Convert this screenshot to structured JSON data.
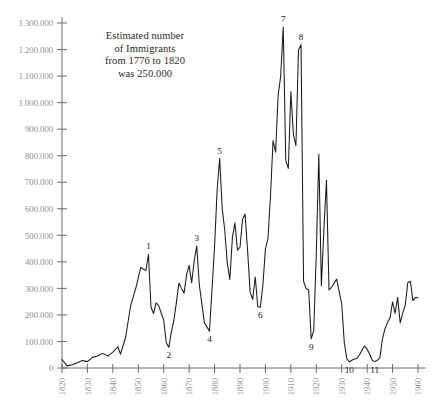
{
  "chart_data": {
    "type": "line",
    "title": "",
    "subtitle": "",
    "xlabel": "",
    "ylabel": "",
    "xlim": [
      1820,
      1960
    ],
    "ylim": [
      0,
      1300000
    ],
    "grid": false,
    "legend": "none",
    "y_tick_labels": [
      "1.300.000",
      "1.200.000",
      "1.100.000",
      "1.000.000",
      "900.000",
      "800.000",
      "700.000",
      "600.000",
      "500.000",
      "400.000",
      "300.000",
      "200.000",
      "100.000",
      "0"
    ],
    "y_tick_values": [
      1300000,
      1200000,
      1100000,
      1000000,
      900000,
      800000,
      700000,
      600000,
      500000,
      400000,
      300000,
      200000,
      100000,
      0
    ],
    "x_tick_labels": [
      "1820",
      "1830",
      "1840",
      "1850",
      "1860",
      "1870",
      "1880",
      "1890",
      "1900",
      "1910",
      "1920",
      "1930",
      "1940",
      "1950",
      "1960"
    ],
    "x_tick_values": [
      1820,
      1830,
      1840,
      1850,
      1860,
      1870,
      1880,
      1890,
      1900,
      1910,
      1920,
      1930,
      1940,
      1950,
      1960
    ],
    "series": [
      {
        "name": "Estimated number of Immigrants",
        "x": [
          1820,
          1822,
          1824,
          1826,
          1828,
          1830,
          1832,
          1834,
          1836,
          1838,
          1840,
          1842,
          1843,
          1845,
          1847,
          1849,
          1851,
          1852,
          1853,
          1854,
          1855,
          1856,
          1857,
          1858,
          1860,
          1861,
          1862,
          1863,
          1864,
          1865,
          1866,
          1867,
          1868,
          1869,
          1870,
          1871,
          1872,
          1873,
          1874,
          1876,
          1878,
          1880,
          1881,
          1882,
          1883,
          1884,
          1885,
          1886,
          1887,
          1888,
          1889,
          1890,
          1891,
          1892,
          1893,
          1894,
          1895,
          1896,
          1897,
          1898,
          1899,
          1900,
          1901,
          1902,
          1903,
          1904,
          1905,
          1906,
          1907,
          1908,
          1909,
          1910,
          1911,
          1912,
          1913,
          1914,
          1915,
          1916,
          1917,
          1918,
          1919,
          1920,
          1921,
          1922,
          1923,
          1924,
          1925,
          1926,
          1928,
          1930,
          1931,
          1932,
          1933,
          1934,
          1935,
          1936,
          1937,
          1938,
          1939,
          1940,
          1941,
          1942,
          1943,
          1944,
          1945,
          1946,
          1947,
          1948,
          1949,
          1950,
          1951,
          1952,
          1953,
          1954,
          1955,
          1956,
          1957,
          1958,
          1959,
          1960
        ],
        "y": [
          32000,
          8000,
          12000,
          20000,
          28000,
          24000,
          40000,
          45000,
          55000,
          45000,
          60000,
          80000,
          52000,
          115000,
          235000,
          300000,
          380000,
          372000,
          368000,
          428000,
          230000,
          205000,
          245000,
          235000,
          180000,
          95000,
          78000,
          135000,
          180000,
          248000,
          320000,
          300000,
          282000,
          352000,
          387000,
          321000,
          405000,
          460000,
          313000,
          170000,
          139000,
          457000,
          669000,
          789000,
          603000,
          519000,
          395000,
          334000,
          490000,
          547000,
          444000,
          455000,
          560000,
          580000,
          440000,
          285000,
          259000,
          343000,
          231000,
          229000,
          312000,
          449000,
          488000,
          649000,
          857000,
          813000,
          1026000,
          1101000,
          1285000,
          783000,
          752000,
          1042000,
          879000,
          838000,
          1198000,
          1218000,
          327000,
          299000,
          295000,
          110000,
          141000,
          430000,
          805000,
          310000,
          523000,
          707000,
          294000,
          304000,
          335000,
          242000,
          97000,
          36000,
          23000,
          29000,
          34000,
          36000,
          50000,
          68000,
          83000,
          71000,
          52000,
          29000,
          24000,
          29000,
          39000,
          109000,
          147000,
          171000,
          189000,
          249000,
          206000,
          266000,
          170000,
          208000,
          238000,
          322000,
          327000,
          254000,
          266000,
          265000
        ]
      }
    ],
    "point_labels": [
      {
        "label": "1",
        "year": 1854,
        "value": 428000
      },
      {
        "label": "2",
        "year": 1862,
        "value": 78000
      },
      {
        "label": "3",
        "year": 1873,
        "value": 460000
      },
      {
        "label": "4",
        "year": 1878,
        "value": 139000
      },
      {
        "label": "5",
        "year": 1882,
        "value": 789000
      },
      {
        "label": "6",
        "year": 1898,
        "value": 229000
      },
      {
        "label": "7",
        "year": 1907,
        "value": 1285000
      },
      {
        "label": "8",
        "year": 1914,
        "value": 1218000
      },
      {
        "label": "9",
        "year": 1918,
        "value": 110000
      },
      {
        "label": "10",
        "year": 1933,
        "value": 23000
      },
      {
        "label": "11",
        "year": 1943,
        "value": 24000
      }
    ],
    "annotation": {
      "lines": [
        "Estimated number",
        "of Immigrants",
        "from 1776 to 1820",
        "was 250.000"
      ]
    },
    "colors": {
      "line": "#1a1a1a",
      "axis": "#6b6b6b",
      "tick_label": "#8d8d8d",
      "annotation_text": "#2a2a2a",
      "point_label": "#1a1a1a",
      "background": "#ffffff"
    }
  }
}
